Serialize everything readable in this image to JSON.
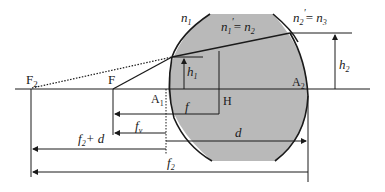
{
  "diagram": {
    "type": "thick-lens-optics",
    "colors": {
      "lens_fill": "#b9b9b9",
      "line": "#1a1a1a",
      "background": "#ffffff"
    },
    "labels": {
      "F2": "F",
      "F2_sub": "2",
      "F": "F",
      "A1": "A",
      "A1_sub": "1",
      "A2": "A",
      "A2_sub": "2",
      "H": "H",
      "n1": "n",
      "n1_sub": "1",
      "n1p": "n",
      "n1p_sub": "1",
      "n1p_prime": "′",
      "n1p_eq": "= ",
      "n1p_rhs": "n",
      "n1p_rhs_sub": "2",
      "n2p": "n",
      "n2p_sub": "2",
      "n2p_prime": "′",
      "n2p_eq": "= ",
      "n2p_rhs": "n",
      "n2p_rhs_sub": "3",
      "h1": "h",
      "h1_sub": "1",
      "h2": "h",
      "h2_sub": "2",
      "f": "f",
      "fv": "f",
      "fv_sub": "v",
      "d": "d",
      "f2d": "f",
      "f2d_sub": "2",
      "f2d_rest": "+ d",
      "f2": "f",
      "f2_sub": "2"
    }
  }
}
